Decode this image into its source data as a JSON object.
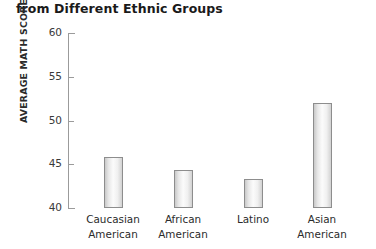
{
  "chart_data": {
    "type": "bar",
    "title": "from Different Ethnic Groups",
    "xlabel": "",
    "ylabel": "AVERAGE MATH SCORES",
    "categories": [
      "Caucasian American",
      "African American",
      "Latino",
      "Asian American"
    ],
    "category_lines": [
      [
        "Caucasian",
        "American"
      ],
      [
        "African",
        "American"
      ],
      [
        "Latino",
        ""
      ],
      [
        "Asian",
        "American"
      ]
    ],
    "values": [
      45.8,
      44.3,
      43.3,
      52.0
    ],
    "ylim": [
      40,
      60
    ],
    "yticks": [
      40,
      45,
      50,
      55,
      60
    ],
    "ytick_labels": [
      "40",
      "45",
      "50",
      "55",
      "60"
    ],
    "grid": false,
    "legend": null,
    "bar_color": "#f2f2f2",
    "bar_border_color": "#8d8d8d",
    "axis_color": "#9b9b9b",
    "text_color": "#231f20"
  }
}
